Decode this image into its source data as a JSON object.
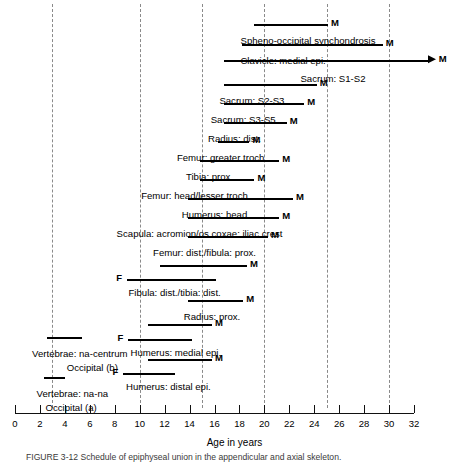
{
  "chart_data": {
    "type": "bar",
    "title": "",
    "xlabel": "Age in years",
    "ylabel": "",
    "xlim": [
      0,
      32
    ],
    "grid": true,
    "gridlines": [
      3,
      10,
      15,
      20,
      25,
      30
    ],
    "tick_values": [
      0,
      2,
      4,
      6,
      8,
      10,
      12,
      14,
      16,
      18,
      20,
      22,
      24,
      26,
      28,
      30,
      32
    ],
    "tick_labels": [
      "0",
      "2",
      "4",
      "6",
      "8",
      "10",
      "12",
      "14",
      "16",
      "18",
      "20",
      "22",
      "24",
      "26",
      "28",
      "30",
      "32"
    ],
    "legend": [
      {
        "key": "M",
        "meaning": "male"
      },
      {
        "key": "F",
        "meaning": "female"
      }
    ],
    "rows": [
      {
        "label": "Spheno-occipital synchondrosis",
        "label_x": 23.5,
        "bars": [
          {
            "sex": "M",
            "start": 19.2,
            "end": 25.1,
            "arrow": false
          }
        ]
      },
      {
        "label": "Clavicle: medial epi.",
        "label_x": 21.5,
        "bars": [
          {
            "sex": "M",
            "start": 18.2,
            "end": 29.5,
            "arrow": false
          }
        ]
      },
      {
        "label": "Sacrum: S1-S2",
        "label_x": 25.5,
        "bars": [
          {
            "sex": "M",
            "start": 16.8,
            "end": 33.1,
            "arrow": true
          }
        ]
      },
      {
        "label": "Sacrum: S2-S3",
        "label_x": 19.0,
        "bars": [
          {
            "sex": "M",
            "start": 16.8,
            "end": 24.2,
            "arrow": false
          }
        ]
      },
      {
        "label": "Sacrum: S3-S5",
        "label_x": 18.3,
        "bars": [
          {
            "sex": "M",
            "start": 16.8,
            "end": 23.2,
            "arrow": false
          }
        ]
      },
      {
        "label": "Radius: dist.",
        "label_x": 17.6,
        "bars": [
          {
            "sex": "M",
            "start": 16.8,
            "end": 21.8,
            "arrow": false
          }
        ]
      },
      {
        "label": "Femur: greater troch.",
        "label_x": 16.6,
        "bars": [
          {
            "sex": "M",
            "start": 16.3,
            "end": 18.8,
            "arrow": false
          }
        ]
      },
      {
        "label": "Tibia: prox.",
        "label_x": 15.6,
        "bars": [
          {
            "sex": "M",
            "start": 14.8,
            "end": 21.2,
            "arrow": false
          }
        ]
      },
      {
        "label": "Femur: head/lesser troch.",
        "label_x": 14.5,
        "bars": [
          {
            "sex": "M",
            "start": 14.8,
            "end": 19.2,
            "arrow": false
          }
        ]
      },
      {
        "label": "Humerus: head",
        "label_x": 16.0,
        "bars": [
          {
            "sex": "M",
            "start": 13.9,
            "end": 22.3,
            "arrow": false
          }
        ]
      },
      {
        "label": "Scapula: acromion/os coxae: iliac crest",
        "label_x": 14.8,
        "bars": [
          {
            "sex": "M",
            "start": 13.9,
            "end": 21.2,
            "arrow": false
          }
        ]
      },
      {
        "label": "Femur: dist./fibula: prox.",
        "label_x": 15.2,
        "bars": [
          {
            "sex": "M",
            "start": 13.9,
            "end": 20.3,
            "arrow": false
          }
        ]
      },
      {
        "label": "Fibula: dist./tibia: dist.",
        "label_x": 12.8,
        "bars": [
          {
            "sex": "M",
            "start": 11.6,
            "end": 18.6,
            "arrow": false
          },
          {
            "sex": "F",
            "start": 9.0,
            "end": 16.1,
            "arrow": false
          }
        ]
      },
      {
        "label": "Radius: prox.",
        "label_x": 15.8,
        "bars": [
          {
            "sex": "M",
            "start": 13.9,
            "end": 18.3,
            "arrow": false
          }
        ]
      },
      {
        "label": "Humerus: medial epi.",
        "label_x": 12.9,
        "bars": [
          {
            "sex": "M",
            "start": 10.7,
            "end": 15.8,
            "arrow": false
          },
          {
            "sex": "F",
            "start": 9.1,
            "end": 14.2,
            "arrow": false
          }
        ]
      },
      {
        "label": "Humerus: distal epi.",
        "label_x": 12.3,
        "bars": [
          {
            "sex": "M",
            "start": 10.7,
            "end": 15.8,
            "arrow": false
          },
          {
            "sex": "F",
            "start": 8.7,
            "end": 12.8,
            "arrow": false
          }
        ]
      },
      {
        "label": "Vertebrae: na-centrum",
        "label_x": 5.2,
        "bars": [
          {
            "sex": "",
            "start": 2.6,
            "end": 5.4,
            "arrow": false
          }
        ]
      },
      {
        "label": "Occipital (b)",
        "label_x": 6.2,
        "bars": []
      },
      {
        "label": "Vertebrae: na-na",
        "label_x": 4.6,
        "bars": [
          {
            "sex": "",
            "start": 2.3,
            "end": 4.0,
            "arrow": false
          }
        ]
      },
      {
        "label": "Occipital (a)",
        "label_x": 4.5,
        "bars": []
      }
    ]
  },
  "caption": {
    "text": "FIGURE 3-12   Schedule of epiphyseal union in the appendicular and axial skeleton."
  },
  "axis": {
    "title": "Age in years"
  }
}
